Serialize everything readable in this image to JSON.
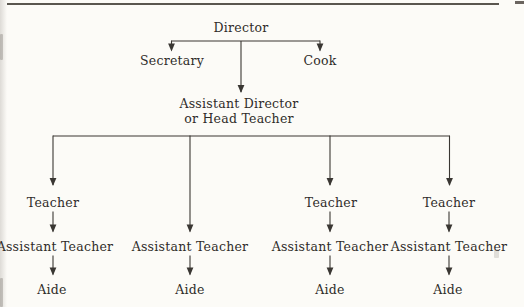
{
  "page": {
    "background_color": "#fcfbf7",
    "rule_color": "#5a564f",
    "line_color": "#3a3733",
    "text_color": "#2f2c29"
  },
  "org_chart": {
    "type": "organizational-chart",
    "root": "Director",
    "staff": {
      "left": "Secretary",
      "right": "Cook"
    },
    "middle_manager": {
      "line1": "Assistant Director",
      "line2": "or Head Teacher"
    },
    "columns": [
      {
        "teacher": "Teacher",
        "assistant_teacher": "Assistant Teacher",
        "aide": "Aide"
      },
      {
        "assistant_teacher": "Assistant Teacher",
        "aide": "Aide"
      },
      {
        "teacher": "Teacher",
        "assistant_teacher": "Assistant Teacher",
        "aide": "Aide"
      },
      {
        "teacher": "Teacher",
        "assistant_teacher": "Assistant Teacher",
        "aide": "Aide"
      }
    ],
    "edges": [
      "Director → Secretary",
      "Director → Cook",
      "Director → Assistant Director or Head Teacher",
      "Assistant Director or Head Teacher → Teacher (columns 1, 3, 4)",
      "Assistant Director or Head Teacher → Assistant Teacher (column 2)",
      "Teacher → Assistant Teacher (columns 1, 3, 4)",
      "Assistant Teacher → Aide (all columns)"
    ]
  }
}
